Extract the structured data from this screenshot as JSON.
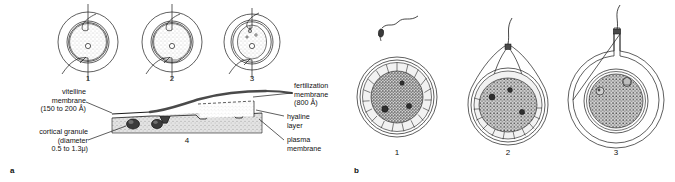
{
  "figure": {
    "panels": [
      {
        "letter": "a",
        "caption_stage_numbers": [
          "1",
          "2",
          "3",
          "4"
        ],
        "callouts": [
          {
            "name": "vitelline-membrane",
            "lines": "vitelline\nmembrane\n(150 to 200 Å)"
          },
          {
            "name": "cortical-granule",
            "lines": "cortical granule\n(diameter\n0.5 to 1.3μ)"
          },
          {
            "name": "fertilization-membrane",
            "lines": "fertilization\nmembrane\n(800 Å)"
          },
          {
            "name": "hyaline-layer",
            "lines": "hyaline\nlayer"
          },
          {
            "name": "plasma-membrane",
            "lines": "plasma\nmembrane"
          }
        ]
      },
      {
        "letter": "b",
        "caption_stage_numbers": [
          "1",
          "2",
          "3"
        ]
      }
    ]
  },
  "labels": {
    "panel_a_letter": "a",
    "panel_b_letter": "b",
    "a_stage_1": "1",
    "a_stage_2": "2",
    "a_stage_3": "3",
    "a_stage_4": "4",
    "b_stage_1": "1",
    "b_stage_2": "2",
    "b_stage_3": "3",
    "vitelline_membrane": "vitelline\nmembrane\n(150 to 200 Å)",
    "cortical_granule": "cortical granule\n(diameter\n0.5 to 1.3μ)",
    "fertilization_membrane": "fertilization\nmembrane\n(800 Å)",
    "hyaline_layer": "hyaline\nlayer",
    "plasma_membrane": "plasma\nmembrane"
  },
  "colors": {
    "ink": "#111111",
    "line": "#1a1a1a",
    "cortex_fill": "#d9d9d9",
    "granule_fill": "#3a3a3a",
    "fert_membrane": "#4a4a4a",
    "stipple": "#8a8a8a",
    "background": "#ffffff"
  }
}
